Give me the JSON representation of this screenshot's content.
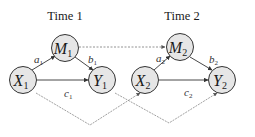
{
  "titles": {
    "time1": "Time 1",
    "time2": "Time 2"
  },
  "nodes": {
    "M1": {
      "var": "M",
      "sub": "1",
      "cx": 65,
      "cy": 48
    },
    "X1": {
      "var": "X",
      "sub": "1",
      "cx": 23,
      "cy": 80
    },
    "Y1": {
      "var": "Y",
      "sub": "1",
      "cx": 102,
      "cy": 80
    },
    "M2": {
      "var": "M",
      "sub": "2",
      "cx": 180,
      "cy": 47
    },
    "X2": {
      "var": "X",
      "sub": "2",
      "cx": 145,
      "cy": 80
    },
    "Y2": {
      "var": "Y",
      "sub": "2",
      "cx": 222,
      "cy": 80
    }
  },
  "edge_labels": {
    "a1": {
      "var": "a",
      "sub": "1"
    },
    "b1": {
      "var": "b",
      "sub": "1"
    },
    "c1": {
      "var": "c",
      "sub": "1"
    },
    "a2": {
      "var": "a",
      "sub": "2"
    },
    "b2": {
      "var": "b",
      "sub": "2"
    },
    "c2": {
      "var": "c",
      "sub": "2"
    }
  },
  "colors": {
    "node_fill": "#e6e6e6",
    "stroke": "#333333",
    "dashed": "#777777"
  }
}
